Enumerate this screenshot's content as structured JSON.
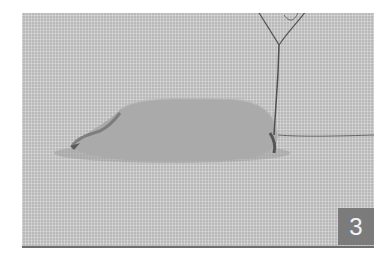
{
  "image": {
    "description": "Step photo: a gray fabric oval shape stitched onto an even-weave canvas with a needle and thread rising at the right end",
    "step_badge": "3",
    "colors": {
      "canvas": "#b9b9b9",
      "shape": "#a9a9a9",
      "badge": "#7b7b7b",
      "badge_text": "#f4f4f4",
      "thread": "#5a5a5a"
    }
  }
}
